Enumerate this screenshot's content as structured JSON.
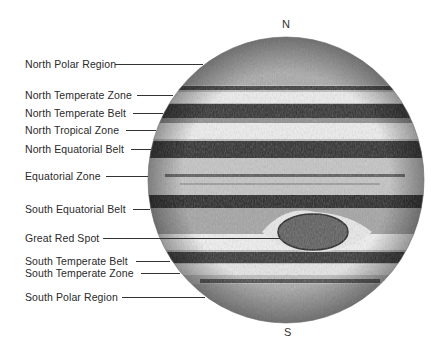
{
  "diagram": {
    "compass": {
      "north": "N",
      "south": "S"
    },
    "labels": [
      {
        "text": "North Polar Region",
        "y": 64,
        "line_start": 115,
        "line_end": 203
      },
      {
        "text": "North Temperate Zone",
        "y": 95,
        "line_start": 137,
        "line_end": 173
      },
      {
        "text": "North Temperate Belt",
        "y": 113,
        "line_start": 133,
        "line_end": 163
      },
      {
        "text": "North Tropical Zone",
        "y": 130,
        "line_start": 126,
        "line_end": 156
      },
      {
        "text": "North Equatorial Belt",
        "y": 149,
        "line_start": 131,
        "line_end": 151
      },
      {
        "text": "Equatorial Zone",
        "y": 176,
        "line_start": 106,
        "line_end": 148
      },
      {
        "text": "South Equatorial Belt",
        "y": 209,
        "line_start": 133,
        "line_end": 150
      },
      {
        "text": "Great Red Spot",
        "y": 238,
        "line_start": 103,
        "line_end": 280
      },
      {
        "text": "South Temperate Belt",
        "y": 261,
        "line_start": 136,
        "line_end": 170
      },
      {
        "text": "South Temperate Zone",
        "y": 273,
        "line_start": 141,
        "line_end": 180
      },
      {
        "text": "South Polar Region",
        "y": 297,
        "line_start": 122,
        "line_end": 205
      }
    ],
    "colors": {
      "background": "#ffffff",
      "disk": "#c9c9c9",
      "dark_belt": "#2e2e2e",
      "light_zone": "#ededed",
      "text": "#2a2a2a",
      "leader": "#333333"
    }
  }
}
